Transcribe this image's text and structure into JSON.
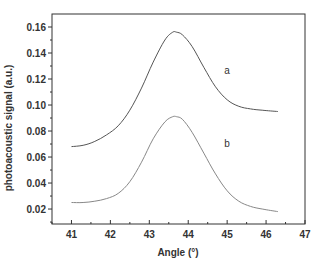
{
  "chart_data": {
    "type": "line",
    "title": "",
    "xlabel": "Angle (°)",
    "ylabel": "photoacoustic signal (a.u.)",
    "xlim": [
      40.5,
      47
    ],
    "ylim": [
      0.0085,
      0.17
    ],
    "x_ticks": [
      "41",
      "42",
      "43",
      "44",
      "45",
      "46",
      "47"
    ],
    "y_ticks": [
      "0.02",
      "0.04",
      "0.06",
      "0.08",
      "0.10",
      "0.12",
      "0.14",
      "0.16"
    ],
    "grid": false,
    "legend": "inline labels",
    "series": [
      {
        "name": "a",
        "color": "#555555",
        "x": [
          41.0,
          41.3,
          41.6,
          41.9,
          42.2,
          42.5,
          42.8,
          43.1,
          43.4,
          43.6,
          43.7,
          43.85,
          44.1,
          44.4,
          44.7,
          45.0,
          45.3,
          45.6,
          45.9,
          46.3
        ],
        "y": [
          0.068,
          0.069,
          0.072,
          0.077,
          0.084,
          0.096,
          0.113,
          0.133,
          0.15,
          0.156,
          0.156,
          0.154,
          0.145,
          0.129,
          0.114,
          0.104,
          0.099,
          0.097,
          0.096,
          0.095
        ]
      },
      {
        "name": "b",
        "color": "#888888",
        "x": [
          41.0,
          41.3,
          41.6,
          41.9,
          42.2,
          42.5,
          42.8,
          43.1,
          43.4,
          43.6,
          43.7,
          43.85,
          44.1,
          44.4,
          44.7,
          45.0,
          45.3,
          45.6,
          45.9,
          46.3
        ],
        "y": [
          0.025,
          0.025,
          0.026,
          0.028,
          0.032,
          0.041,
          0.056,
          0.074,
          0.087,
          0.091,
          0.091,
          0.089,
          0.079,
          0.063,
          0.047,
          0.034,
          0.026,
          0.022,
          0.02,
          0.018
        ]
      }
    ],
    "annotations": [
      {
        "text": "a",
        "x": 45.0,
        "y": 0.126
      },
      {
        "text": "b",
        "x": 45.0,
        "y": 0.07
      }
    ]
  }
}
